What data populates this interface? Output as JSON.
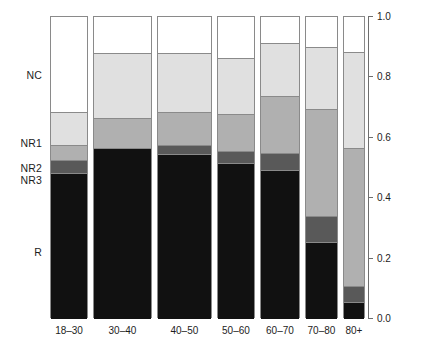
{
  "chart_data": {
    "type": "bar",
    "subtype": "stacked-proportional-spineplot",
    "title": "",
    "xlabel": "",
    "ylabel": "",
    "ylim": [
      0.0,
      1.0
    ],
    "grid": false,
    "legend_position": "left-row-labels",
    "categories": [
      "18–30",
      "30–40",
      "40–50",
      "50–60",
      "60–70",
      "70–80",
      "80+"
    ],
    "category_widths": [
      0.121,
      0.187,
      0.175,
      0.121,
      0.127,
      0.105,
      0.07
    ],
    "stack_order_bottom_to_top": [
      "R",
      "NR3",
      "NR2",
      "NR1",
      "NC"
    ],
    "row_labels": [
      "NC",
      "NR1",
      "NR2",
      "NR3",
      "R"
    ],
    "row_label_positions": [
      0.8,
      0.575,
      0.495,
      0.455,
      0.215
    ],
    "series": [
      {
        "name": "R",
        "color": "#111111",
        "values": [
          0.485,
          0.565,
          0.545,
          0.515,
          0.495,
          0.255,
          0.055
        ]
      },
      {
        "name": "NR3",
        "color": "#595959",
        "values": [
          0.04,
          0.0,
          0.03,
          0.04,
          0.055,
          0.085,
          0.055
        ]
      },
      {
        "name": "NR2",
        "color": "#b0b0b0",
        "values": [
          0.05,
          0.1,
          0.11,
          0.125,
          0.19,
          0.355,
          0.455
        ]
      },
      {
        "name": "NR1",
        "color": "#e0e0e0",
        "values": [
          0.11,
          0.215,
          0.195,
          0.185,
          0.175,
          0.205,
          0.32
        ]
      },
      {
        "name": "NC",
        "color": "#ffffff",
        "values": [
          0.315,
          0.12,
          0.12,
          0.135,
          0.085,
          0.1,
          0.115
        ]
      }
    ],
    "y_ticks": [
      {
        "value": 0.0,
        "label": "0.0"
      },
      {
        "value": 0.2,
        "label": "0.2"
      },
      {
        "value": 0.4,
        "label": "0.4"
      },
      {
        "value": 0.6,
        "label": "0.6"
      },
      {
        "value": 0.8,
        "label": "0.8"
      },
      {
        "value": 1.0,
        "label": "1.0"
      }
    ],
    "colors": {
      "NC": "#ffffff",
      "NR1": "#e0e0e0",
      "NR2": "#b0b0b0",
      "NR3": "#595959",
      "R": "#111111",
      "border": "#8a8a8a",
      "axis": "#6e6e6e",
      "text": "#1d1d1d",
      "background": "#ffffff"
    }
  }
}
